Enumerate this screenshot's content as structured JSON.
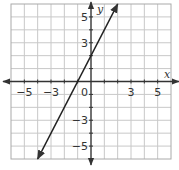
{
  "chart_data": {
    "type": "line",
    "title": "",
    "xlabel": "x",
    "ylabel": "y",
    "xlim": [
      -6,
      6
    ],
    "ylim": [
      -6,
      6
    ],
    "grid": true,
    "x_ticks": [
      -5,
      -3,
      0,
      3,
      5
    ],
    "x_tick_labels": [
      "−5",
      "−3",
      "0",
      "3",
      "5"
    ],
    "y_ticks": [
      5,
      3,
      -3,
      -5
    ],
    "y_tick_labels": [
      "5",
      "3",
      "−3",
      "−5"
    ],
    "origin_label": "0",
    "series": [
      {
        "name": "y = 2x + 2",
        "slope": 2,
        "intercept": 2,
        "x": [
          -4,
          2
        ],
        "y": [
          -6,
          6
        ],
        "arrows": "both"
      }
    ]
  },
  "colors": {
    "grid": "#c8c8c8",
    "border": "#aaaaaa",
    "axis": "#333333",
    "line": "#222222"
  }
}
